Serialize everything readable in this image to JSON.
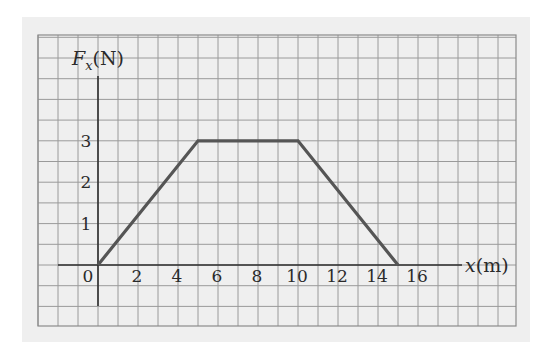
{
  "chart_data": {
    "type": "line",
    "title": "",
    "xlabel": "x(m)",
    "ylabel": "F_x(N)",
    "ylabel_parts": {
      "symbol": "F",
      "subscript": "x",
      "unit": "(N)"
    },
    "xlabel_parts": {
      "symbol": "x",
      "unit": "(m)"
    },
    "x": [
      0,
      5,
      10,
      15
    ],
    "series": [
      {
        "name": "F_x",
        "values": [
          0,
          3,
          3,
          0
        ]
      }
    ],
    "xticks": [
      "0",
      "2",
      "4",
      "6",
      "8",
      "10",
      "12",
      "14",
      "16"
    ],
    "yticks": [
      "1",
      "2",
      "3"
    ],
    "origin_label": "0",
    "xlim": [
      -2,
      18
    ],
    "ylim": [
      -1,
      4.5
    ],
    "grid": true,
    "grid_minor_x": 1,
    "grid_minor_y": 0.5,
    "legend": null,
    "colors": {
      "line": "#555555",
      "grid": "#9a9a9a",
      "axis": "#2e2e2e",
      "paper": "#efefef"
    }
  }
}
